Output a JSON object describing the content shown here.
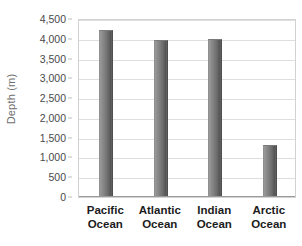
{
  "chart_data": {
    "type": "bar",
    "title": "",
    "xlabel": "",
    "ylabel": "Depth (m)",
    "categories": [
      "Pacific Ocean",
      "Atlantic Ocean",
      "Indian Ocean",
      "Arctic Ocean"
    ],
    "category_lines": [
      [
        "Pacific",
        "Ocean"
      ],
      [
        "Atlantic",
        "Ocean"
      ],
      [
        "Indian",
        "Ocean"
      ],
      [
        "Arctic",
        "Ocean"
      ]
    ],
    "values": [
      4200,
      3950,
      3980,
      1300
    ],
    "ylim": [
      0,
      4500
    ],
    "ytick_values": [
      0,
      500,
      1000,
      1500,
      2000,
      2500,
      3000,
      3500,
      4000,
      4500
    ],
    "ytick_labels": [
      "0",
      "500",
      "1,000",
      "1,500",
      "2,000",
      "2,500",
      "3,000",
      "3,500",
      "4,000",
      "4,500"
    ],
    "grid": true,
    "legend": "none",
    "bar_color": "#7a7a7a",
    "gridline_color": "#dedede",
    "axis_color": "#9a9a9a",
    "background_color": "#ffffff"
  }
}
